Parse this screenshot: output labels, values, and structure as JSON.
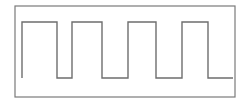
{
  "figure": {
    "type": "waveform-diagram",
    "canvas": {
      "width": 247,
      "height": 103,
      "background": "#ffffff"
    },
    "frame": {
      "name": "border-rectangle",
      "x": 15,
      "y": 6,
      "width": 220,
      "height": 91,
      "stroke_color": "#7a7a7a",
      "stroke_width": 1.2,
      "fill_color": "#ffffff"
    },
    "waveform": {
      "name": "square-wave-trace",
      "stroke_color": "#6e6e6e",
      "stroke_width": 1.4,
      "low_level_y": 78,
      "high_level_y": 22,
      "start_x": 22,
      "end_x": 233,
      "pulse_count": 4,
      "duty_description": "high 20 px, low 12 px, period 32 px",
      "edges_x": [
        22,
        42,
        54,
        72,
        102,
        128,
        156,
        182,
        208
      ],
      "path": "M 22 78 L 22 22 L 57 22 L 57 78 L 72 78 L 72 22 L 102 22 L 102 78 L 128 78 L 128 22 L 156 22 L 156 78 L 182 78 L 182 22 L 208 22 L 208 78 L 233 78"
    }
  },
  "chart_data": {
    "type": "line",
    "xlabel": "",
    "ylabel": "",
    "xlim": [
      22,
      233
    ],
    "ylim": [
      0,
      1
    ],
    "grid": false,
    "legend": "none",
    "series": [
      {
        "name": "square-wave",
        "x": [
          22,
          22,
          57,
          57,
          72,
          72,
          102,
          102,
          128,
          128,
          156,
          156,
          182,
          182,
          208,
          208,
          233
        ],
        "values": [
          0,
          1,
          1,
          0,
          0,
          1,
          1,
          0,
          0,
          1,
          1,
          0,
          0,
          1,
          1,
          0,
          0
        ]
      }
    ]
  }
}
